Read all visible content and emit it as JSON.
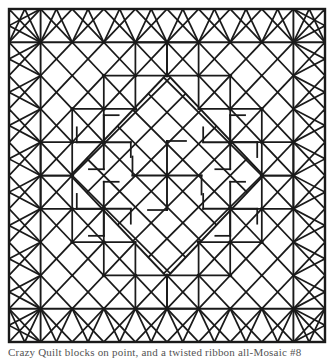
{
  "figure": {
    "kind": "geometric-quilt-mosaic-diagram",
    "caption": "Crazy Quilt blocks on point, and a twisted ribbon all-Mosaic #8",
    "caption_visibility": "cropped-at-page-edge",
    "colors": {
      "ink": "#1a1a1a",
      "paper": "#ffffff",
      "caption_ink": "#3a3a3a"
    },
    "frame": {
      "x": 9,
      "y": 9,
      "width": 316,
      "height": 333,
      "stroke_width": 2.2,
      "label": "outer border rectangle"
    },
    "grid": {
      "columns": 10,
      "rows": 10,
      "cell_px": 31.6,
      "origin_x": 9,
      "origin_y": 11,
      "line_width": 1.7
    },
    "regions": [
      {
        "name": "outer-lattice-band",
        "description": "ring of square cells each crossed by both diagonals forming X / star nodes, set on point",
        "cells": 64
      },
      {
        "name": "central-weave",
        "description": "interlaced diagonal ribbon bands forming a basketweave field",
        "bands": 8
      },
      {
        "name": "pinwheel-motifs",
        "description": "four-armed pinwheel rosettes at weave intersections",
        "count": 5
      }
    ]
  }
}
